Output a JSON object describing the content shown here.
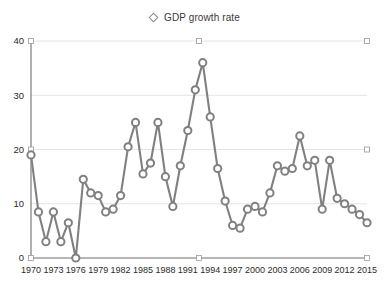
{
  "legend": {
    "position": "top-center",
    "entries": [
      {
        "label": "GDP growth rate",
        "marker": "diamond-outline-icon",
        "color": "#808080"
      }
    ]
  },
  "axes": {
    "y_ticks": [
      "0",
      "10",
      "20",
      "30",
      "40"
    ],
    "x_ticks": [
      "1970",
      "1973",
      "1976",
      "1979",
      "1982",
      "1985",
      "1988",
      "1991",
      "1994",
      "1997",
      "2000",
      "2003",
      "2006",
      "2009",
      "2012",
      "2015"
    ]
  },
  "colors": {
    "series": "#808080",
    "grid": "#d8d8d8",
    "axis": "#6f6f6f",
    "background": "#ffffff",
    "text": "#2b2b2b"
  },
  "chart_data": {
    "type": "line",
    "title": "",
    "subtitle": "",
    "xlabel": "",
    "ylabel": "",
    "xlim": [
      1970,
      2015
    ],
    "ylim": [
      0,
      40
    ],
    "grid": true,
    "legend_position": "top-center",
    "x": [
      1970,
      1971,
      1972,
      1973,
      1974,
      1975,
      1976,
      1977,
      1978,
      1979,
      1980,
      1981,
      1982,
      1983,
      1984,
      1985,
      1986,
      1987,
      1988,
      1989,
      1990,
      1991,
      1992,
      1993,
      1994,
      1995,
      1996,
      1997,
      1998,
      1999,
      2000,
      2001,
      2002,
      2003,
      2004,
      2005,
      2006,
      2007,
      2008,
      2009,
      2010,
      2011,
      2012,
      2013,
      2014,
      2015
    ],
    "series": [
      {
        "name": "GDP growth rate",
        "color": "#808080",
        "marker": "circle-outline",
        "values": [
          19.0,
          8.5,
          3.0,
          8.5,
          3.0,
          6.5,
          0.0,
          14.5,
          12.0,
          11.5,
          8.5,
          9.0,
          11.5,
          20.5,
          25.0,
          15.5,
          17.5,
          25.0,
          15.0,
          9.5,
          17.0,
          23.5,
          31.0,
          36.0,
          26.0,
          16.5,
          10.5,
          6.0,
          5.5,
          9.0,
          9.5,
          8.5,
          12.0,
          17.0,
          16.0,
          16.5,
          22.5,
          17.0,
          18.0,
          9.0,
          18.0,
          11.0,
          10.0,
          9.0,
          8.0,
          6.5
        ]
      }
    ]
  }
}
